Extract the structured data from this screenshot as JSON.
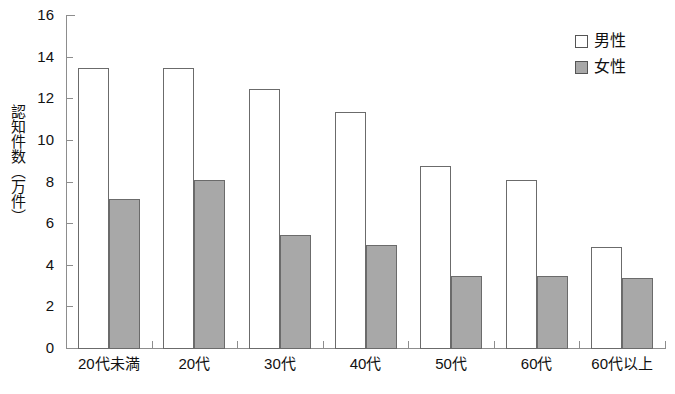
{
  "chart_data": {
    "type": "bar",
    "title": "",
    "xlabel": "",
    "ylabel": "認知件数（万件）",
    "ylim": [
      0,
      16
    ],
    "yticks": [
      0,
      2,
      4,
      6,
      8,
      10,
      12,
      14,
      16
    ],
    "grid": false,
    "legend_position": "top-right",
    "categories": [
      "20代未満",
      "20代",
      "30代",
      "40代",
      "50代",
      "60代",
      "60代以上"
    ],
    "series": [
      {
        "name": "男性",
        "color": "#ffffff",
        "values": [
          13.5,
          13.5,
          12.5,
          11.4,
          8.8,
          8.1,
          4.9
        ]
      },
      {
        "name": "女性",
        "color": "#a8a8a8",
        "values": [
          7.2,
          8.1,
          5.5,
          5.0,
          3.5,
          3.5,
          3.4
        ]
      }
    ]
  },
  "axes": {
    "y_title": "認知件数（万件）",
    "tick_labels": [
      "16",
      "14",
      "12",
      "10",
      "8",
      "6",
      "4",
      "2",
      "0"
    ]
  },
  "legend": {
    "entries": [
      {
        "label": "男性",
        "swatch": "male"
      },
      {
        "label": "女性",
        "swatch": "female"
      }
    ]
  }
}
